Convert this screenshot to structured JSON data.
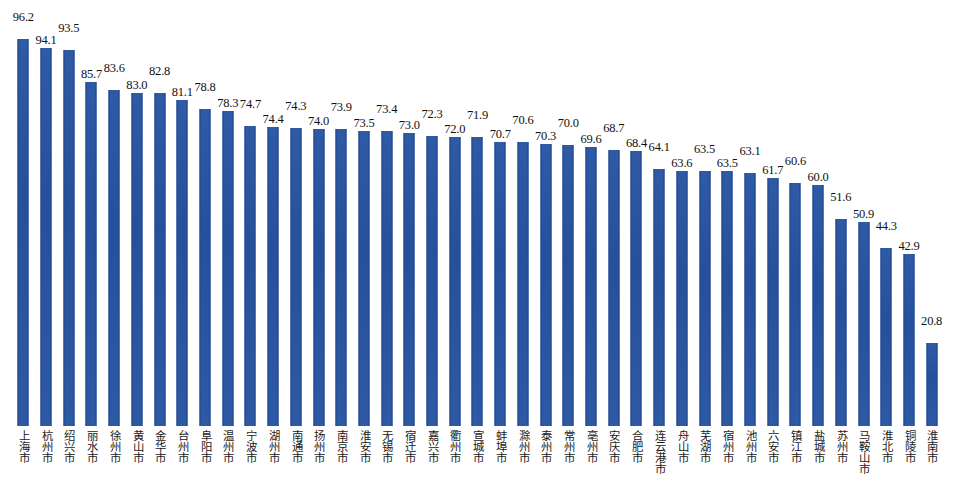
{
  "chart_data": {
    "type": "bar",
    "title": "",
    "subtitle": "",
    "xlabel": "",
    "ylabel": "",
    "ylim": [
      0,
      100
    ],
    "grid": false,
    "legend": null,
    "bar_color": "#2b55a0",
    "background": "#ffffff",
    "value_labels_shown": true,
    "categories": [
      "上海市",
      "杭州市",
      "绍兴市",
      "丽水市",
      "徐州市",
      "黄山市",
      "金华市",
      "台州市",
      "阜阳市",
      "温州市",
      "宁波市",
      "湖州市",
      "南通市",
      "扬州市",
      "南京市",
      "淮安市",
      "无锡市",
      "宿迁市",
      "嘉兴市",
      "衢州市",
      "宣城市",
      "蚌埠市",
      "滁州市",
      "泰州市",
      "常州市",
      "亳州市",
      "安庆市",
      "合肥市",
      "连云港市",
      "舟山市",
      "芜湖市",
      "宿州市",
      "池州市",
      "六安市",
      "镇江市",
      "盐城市",
      "苏州市",
      "马鞍山市",
      "淮北市",
      "铜陵市",
      "淮南市"
    ],
    "values": [
      96.2,
      94.1,
      93.5,
      85.7,
      83.6,
      83.0,
      82.8,
      81.1,
      78.8,
      78.3,
      74.7,
      74.4,
      74.3,
      74.0,
      73.9,
      73.5,
      73.4,
      73.0,
      72.3,
      72.0,
      71.9,
      70.7,
      70.6,
      70.3,
      70.0,
      69.6,
      68.7,
      68.4,
      64.1,
      63.6,
      63.5,
      63.5,
      63.1,
      61.7,
      60.6,
      60.0,
      51.6,
      50.9,
      44.3,
      42.9,
      20.8
    ]
  },
  "meta": {
    "value_label_decimals": 1
  }
}
